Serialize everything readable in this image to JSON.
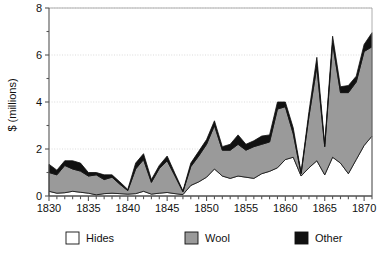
{
  "chart_data": {
    "type": "area",
    "stacked": true,
    "title": "",
    "subtitle": "",
    "xlabel": "",
    "ylabel": "$ (millions)",
    "xlim": [
      1830,
      1871
    ],
    "ylim": [
      0,
      8
    ],
    "grid": true,
    "grid_axis": "y",
    "legend_position": "bottom",
    "y_ticks_major": [
      0,
      2,
      4,
      6,
      8
    ],
    "y_ticks_minor": [
      1,
      3,
      5,
      7
    ],
    "y_tick_labels": [
      "0",
      "2",
      "4",
      "6",
      "8"
    ],
    "x_ticks_major": [
      1830,
      1835,
      1840,
      1845,
      1850,
      1855,
      1860,
      1865,
      1870
    ],
    "x_tick_labels": [
      "1830",
      "1835",
      "1840",
      "1845",
      "1850",
      "1855",
      "1860",
      "1865",
      "1870"
    ],
    "x": [
      1830,
      1831,
      1832,
      1833,
      1834,
      1835,
      1836,
      1837,
      1838,
      1839,
      1840,
      1841,
      1842,
      1843,
      1844,
      1845,
      1846,
      1847,
      1848,
      1849,
      1850,
      1851,
      1852,
      1853,
      1854,
      1855,
      1856,
      1857,
      1858,
      1859,
      1860,
      1861,
      1862,
      1863,
      1864,
      1865,
      1866,
      1867,
      1868,
      1869,
      1870,
      1871
    ],
    "series": [
      {
        "name": "Hides",
        "color": "#ffffff",
        "values": [
          0.2,
          0.12,
          0.14,
          0.2,
          0.16,
          0.12,
          0.05,
          0.1,
          0.12,
          0.1,
          0.08,
          0.1,
          0.2,
          0.08,
          0.12,
          0.15,
          0.1,
          0.06,
          0.45,
          0.6,
          0.8,
          1.15,
          0.85,
          0.75,
          0.85,
          0.8,
          0.75,
          0.95,
          1.05,
          1.2,
          1.55,
          1.65,
          0.85,
          1.2,
          1.5,
          0.9,
          1.65,
          1.4,
          0.95,
          1.55,
          2.15,
          2.55
        ]
      },
      {
        "name": "Wool",
        "color": "#9a9a9a",
        "values": [
          0.8,
          0.78,
          1.16,
          0.95,
          0.9,
          0.73,
          0.85,
          0.6,
          0.68,
          0.4,
          0.15,
          1.05,
          1.35,
          0.5,
          1.05,
          1.35,
          0.75,
          0.12,
          0.8,
          1.1,
          1.4,
          1.85,
          1.1,
          1.2,
          1.35,
          1.15,
          1.35,
          1.25,
          1.25,
          2.5,
          2.25,
          1.0,
          0.1,
          2.2,
          4.0,
          1.2,
          4.85,
          3.0,
          3.45,
          3.3,
          4.0,
          3.8
        ]
      },
      {
        "name": "Other",
        "color": "#111111",
        "values": [
          0.35,
          0.2,
          0.2,
          0.35,
          0.34,
          0.15,
          0.1,
          0.2,
          0.1,
          0.1,
          0.05,
          0.25,
          0.25,
          0.12,
          0.13,
          0.2,
          0.1,
          0.04,
          0.15,
          0.2,
          0.2,
          0.2,
          0.15,
          0.25,
          0.4,
          0.25,
          0.25,
          0.35,
          0.3,
          0.3,
          0.2,
          0.25,
          0.05,
          0.2,
          0.4,
          0.1,
          0.3,
          0.25,
          0.3,
          0.25,
          0.3,
          0.6
        ]
      }
    ]
  },
  "legend": {
    "items": [
      {
        "label": "Hides",
        "color": "#ffffff",
        "stroke": "#111111"
      },
      {
        "label": "Wool",
        "color": "#9a9a9a",
        "stroke": "#9a9a9a"
      },
      {
        "label": "Other",
        "color": "#111111",
        "stroke": "#111111"
      }
    ]
  },
  "axes": {
    "y_title": "$ (millions)"
  },
  "colors": {
    "axis": "#555555",
    "grid": "#cccccc",
    "outline": "#111111",
    "background": "#ffffff"
  }
}
